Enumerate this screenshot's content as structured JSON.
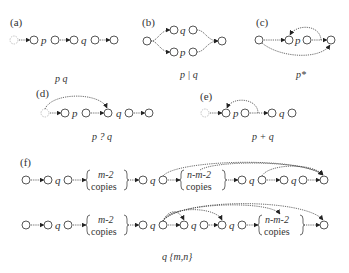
{
  "panels": {
    "a": {
      "label": "(a)",
      "symbols": [
        "p",
        "q"
      ],
      "caption": "p q"
    },
    "b": {
      "label": "(b)",
      "symbols": [
        "q",
        "p"
      ],
      "caption": "p | q"
    },
    "c": {
      "label": "(c)",
      "symbols": [
        "p"
      ],
      "caption": "p*"
    },
    "d": {
      "label": "(d)",
      "symbols": [
        "p",
        "q"
      ],
      "caption": "p ? q"
    },
    "e": {
      "label": "(e)",
      "symbols": [
        "p",
        "q"
      ],
      "caption": "p + q"
    },
    "f": {
      "label": "(f)",
      "row1": {
        "symbols": [
          "q",
          "q",
          "q",
          "q"
        ],
        "box1": [
          "m-2",
          "copies"
        ],
        "box2": [
          "n-m-2",
          "copies"
        ]
      },
      "row2": {
        "symbols": [
          "q",
          "q",
          "q",
          "q"
        ],
        "box1": [
          "m-2",
          "copies"
        ],
        "box2": [
          "n-m-2",
          "copies"
        ]
      },
      "caption": "q {m,n}"
    }
  }
}
